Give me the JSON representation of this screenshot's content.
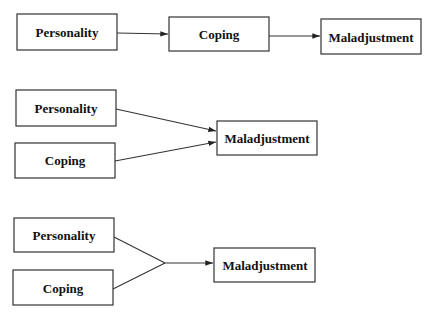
{
  "diagrams": [
    {
      "name": "mediation-model",
      "nodes": [
        {
          "id": "personality",
          "label": "Personality"
        },
        {
          "id": "coping",
          "label": "Coping"
        },
        {
          "id": "maladjustment",
          "label": "Maladjustment"
        }
      ],
      "edges": [
        {
          "from": "personality",
          "to": "coping"
        },
        {
          "from": "coping",
          "to": "maladjustment"
        }
      ]
    },
    {
      "name": "additive-model",
      "nodes": [
        {
          "id": "personality",
          "label": "Personality"
        },
        {
          "id": "coping",
          "label": "Coping"
        },
        {
          "id": "maladjustment",
          "label": "Maladjustment"
        }
      ],
      "edges": [
        {
          "from": "personality",
          "to": "maladjustment"
        },
        {
          "from": "coping",
          "to": "maladjustment"
        }
      ]
    },
    {
      "name": "interaction-model",
      "nodes": [
        {
          "id": "personality",
          "label": "Personality"
        },
        {
          "id": "coping",
          "label": "Coping"
        },
        {
          "id": "maladjustment",
          "label": "Maladjustment"
        }
      ],
      "edges": [
        {
          "from": "personality",
          "to": "junction"
        },
        {
          "from": "coping",
          "to": "junction"
        },
        {
          "from": "junction",
          "to": "maladjustment"
        }
      ]
    }
  ]
}
